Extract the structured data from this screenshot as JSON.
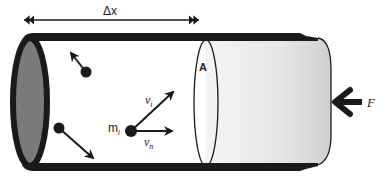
{
  "diagram": {
    "labels": {
      "displacement": "Δx",
      "area": "A",
      "mass": "m",
      "mass_subscript": "i",
      "velocity": "v",
      "velocity_subscript": "i",
      "normal_velocity": "v",
      "normal_velocity_subscript": "n",
      "force": "F"
    },
    "colors": {
      "outline": "#1a1a1a",
      "end_cap_fill": "#7a7a7a",
      "piston_fill_light": "#f2f2f2",
      "piston_fill_dark": "#d4d4d4",
      "background": "#ffffff"
    },
    "molecules": [
      {
        "name": "molecule-top",
        "x": 86,
        "y": 72,
        "arrow_to": [
          70,
          52
        ]
      },
      {
        "name": "molecule-bottom",
        "x": 59,
        "y": 128,
        "arrow_to": [
          94,
          158
        ]
      },
      {
        "name": "molecule-i",
        "x": 131,
        "y": 131,
        "arrow_vi": [
          174,
          91
        ],
        "arrow_vn": [
          173,
          131
        ]
      }
    ]
  }
}
